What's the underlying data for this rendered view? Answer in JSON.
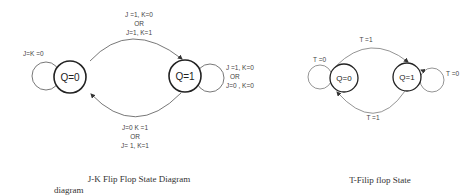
{
  "jk_diagram": {
    "states": [
      {
        "id": "q0",
        "label": "Q=0"
      },
      {
        "id": "q1",
        "label": "Q=1"
      }
    ],
    "transitions": {
      "q0_self": [
        "J=K =0"
      ],
      "q0_to_q1": [
        "J =1, K=0",
        "OR",
        "J=1, K=1"
      ],
      "q1_self": [
        "J =1, K=0",
        "OR",
        "J=0 , K=0"
      ],
      "q1_to_q0": [
        "J=0  K =1",
        "OR",
        "J= 1, K=1"
      ]
    },
    "caption": "J-K Flip Flop State Diagram",
    "caption_extra": "diagram"
  },
  "t_diagram": {
    "states": [
      {
        "id": "q0",
        "label": "Q=0"
      },
      {
        "id": "q1",
        "label": "Q=1"
      }
    ],
    "transitions": {
      "q0_self": "T =0",
      "q0_to_q1": "T =1",
      "q1_self": "T =0",
      "q1_to_q0": "T =1"
    },
    "caption": "T-Filip flop State"
  }
}
